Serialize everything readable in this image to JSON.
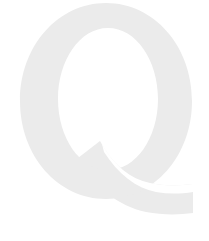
{
  "page": {
    "width": 209,
    "height": 241,
    "background_color": "#ffffff",
    "content_type": "watermark-glyph"
  },
  "watermark": {
    "character": "Q",
    "description": "Large light-gray serif capital letter Q watermark",
    "glyph_name": "letter-q-glyph",
    "fill_color": "#ebebeb",
    "counter_color": "#ffffff",
    "typeface_style": "serif",
    "bounds": {
      "left": 20,
      "top": 3,
      "right": 193,
      "bottom": 222
    },
    "bowl": {
      "center_x": 106,
      "center_y": 101,
      "radius_x": 86,
      "radius_y": 98
    },
    "counter": {
      "center_x": 108,
      "center_y": 99,
      "radius_x": 50,
      "radius_y": 71
    },
    "tail": {
      "start_x": 88,
      "start_y": 176,
      "end_x": 193,
      "end_y": 222,
      "thickness": 34
    }
  }
}
